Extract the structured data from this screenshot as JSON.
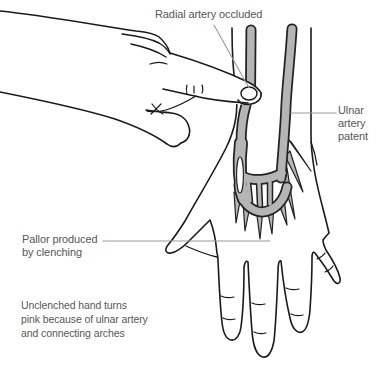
{
  "figure": {
    "type": "medical-line-illustration"
  },
  "labels": {
    "radial": "Radial artery occluded",
    "ulnar": "Ulnar\nartery\npatent",
    "pallor": "Pallor produced\nby clenching",
    "note": "Unclenched hand turns\npink because of ulnar artery\nand connecting arches"
  },
  "colors": {
    "background": "#ffffff",
    "artery_fill": "#b5b5b5",
    "artery_outline": "#222222",
    "line_art": "#1a1a1a",
    "label_text": "#575757",
    "leader_line": "#999999"
  }
}
